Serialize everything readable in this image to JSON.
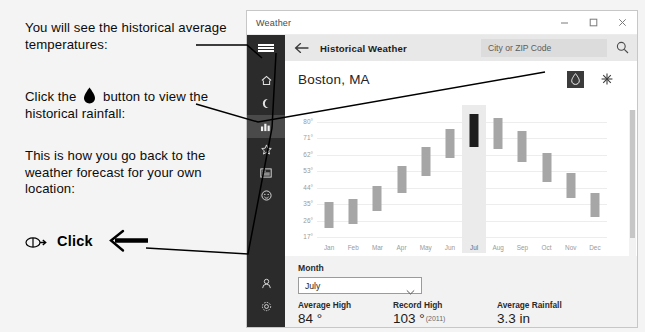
{
  "annotations": {
    "note1": "You will see the historical average temperatures:",
    "note2_before": "Click the",
    "note2_after": "button to view the historical rainfall:",
    "note3": "This is how you go back to the weather forecast for your own location:",
    "click_label": "Click",
    "drop_icon": "water-drop-icon",
    "mouse_icon": "mouse-click-icon",
    "arrow_icon": "arrow-left-icon"
  },
  "window": {
    "title": "Weather",
    "controls": {
      "minimize": "minimize-icon",
      "maximize": "maximize-icon",
      "close": "close-icon"
    }
  },
  "navbar": {
    "menu_icon": "hamburger-menu-icon",
    "back_icon": "back-arrow-icon",
    "title": "Historical Weather",
    "search_placeholder": "City or ZIP Code",
    "search_icon": "search-icon"
  },
  "rail": {
    "items": [
      {
        "name": "forecast",
        "icon": "home-icon",
        "selected": false
      },
      {
        "name": "maps",
        "icon": "moon-icon",
        "selected": false
      },
      {
        "name": "historical-weather",
        "icon": "chart-icon",
        "selected": true
      },
      {
        "name": "favorites",
        "icon": "star-icon",
        "selected": false
      },
      {
        "name": "news",
        "icon": "news-icon",
        "selected": false
      },
      {
        "name": "feedback",
        "icon": "smiley-icon",
        "selected": false
      }
    ],
    "bottom": [
      {
        "name": "account",
        "icon": "person-icon"
      },
      {
        "name": "settings",
        "icon": "gear-icon"
      }
    ]
  },
  "main": {
    "city": "Boston, MA",
    "toggles": [
      {
        "name": "rainfall",
        "icon": "water-drop-icon",
        "active": true
      },
      {
        "name": "snowfall",
        "icon": "snowflake-icon",
        "active": false
      }
    ]
  },
  "chart_data": {
    "type": "bar",
    "title": "",
    "xlabel": "",
    "ylabel": "",
    "unit": "°F",
    "grid": true,
    "legend": false,
    "ylim": [
      17,
      89
    ],
    "yticks": [
      "80°",
      "71°",
      "62°",
      "53°",
      "44°",
      "35°",
      "26°",
      "17°"
    ],
    "ytick_values": [
      80,
      71,
      62,
      53,
      44,
      35,
      26,
      17
    ],
    "categories": [
      "Jan",
      "Feb",
      "Mar",
      "Apr",
      "May",
      "Jun",
      "Jul",
      "Aug",
      "Sep",
      "Oct",
      "Nov",
      "Dec"
    ],
    "selected_category": "Jul",
    "series": [
      {
        "name": "Average Low",
        "values": [
          22,
          24,
          31,
          41,
          50,
          60,
          66,
          65,
          58,
          47,
          38,
          28
        ]
      },
      {
        "name": "Average High",
        "values": [
          36,
          38,
          45,
          56,
          66,
          76,
          84,
          82,
          75,
          63,
          52,
          41
        ]
      }
    ]
  },
  "month_picker": {
    "label": "Month",
    "value": "July",
    "chevron_icon": "chevron-down-icon",
    "options": [
      "January",
      "February",
      "March",
      "April",
      "May",
      "June",
      "July",
      "August",
      "September",
      "October",
      "November",
      "December"
    ]
  },
  "stats": [
    {
      "key": "Average High",
      "value": "84 °",
      "note": ""
    },
    {
      "key": "Record High",
      "value": "103 °",
      "note": "(2011)"
    },
    {
      "key": "Average Rainfall",
      "value": "3.3 in",
      "note": ""
    }
  ]
}
